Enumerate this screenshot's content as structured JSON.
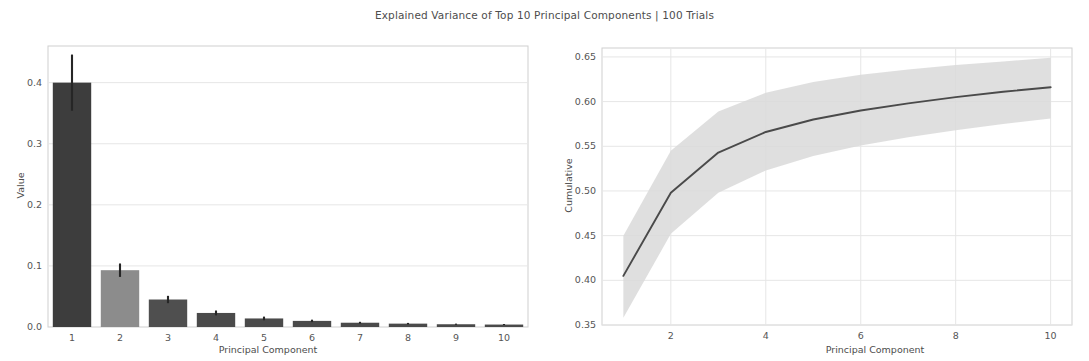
{
  "figure": {
    "title": "Explained Variance of Top 10 Principal Components | 100 Trials",
    "width": 1089,
    "height": 361,
    "background": "#ffffff",
    "text_color": "#4d4d4d"
  },
  "colors": {
    "bar_dark": "#3d3d3d",
    "bar_mid": "#8c8c8c",
    "bar_3": "#4f4f4f",
    "errorbar": "#262626",
    "line": "#4a4a4a",
    "band": "#d9d9d9",
    "grid": "#e6e6e6",
    "frame": "#cfcfcf"
  },
  "chart_data": [
    {
      "type": "bar",
      "panel": "left",
      "title": "",
      "xlabel": "Principal Component",
      "ylabel": "Value",
      "categories": [
        "1",
        "2",
        "3",
        "4",
        "5",
        "6",
        "7",
        "8",
        "9",
        "10"
      ],
      "values": [
        0.4,
        0.093,
        0.045,
        0.023,
        0.014,
        0.01,
        0.007,
        0.0055,
        0.0045,
        0.004
      ],
      "errors": [
        0.046,
        0.011,
        0.006,
        0.004,
        0.003,
        0.002,
        0.0015,
        0.0012,
        0.001,
        0.0009
      ],
      "bar_colors": [
        "#3d3d3d",
        "#8c8c8c",
        "#4f4f4f",
        "#4a4a4a",
        "#4a4a4a",
        "#4a4a4a",
        "#4a4a4a",
        "#4a4a4a",
        "#4a4a4a",
        "#4a4a4a"
      ],
      "ylim": [
        0.0,
        0.46
      ],
      "yticks": [
        0.0,
        0.1,
        0.2,
        0.3,
        0.4
      ],
      "ytick_labels": [
        "0.0",
        "0.1",
        "0.2",
        "0.3",
        "0.4"
      ],
      "xtick_labels": [
        "1",
        "2",
        "3",
        "4",
        "5",
        "6",
        "7",
        "8",
        "9",
        "10"
      ],
      "grid": true,
      "legend": "none"
    },
    {
      "type": "line",
      "panel": "right",
      "title": "",
      "xlabel": "Principal Component",
      "ylabel": "Cumulative",
      "x": [
        1,
        2,
        3,
        4,
        5,
        6,
        7,
        8,
        9,
        10
      ],
      "series": [
        {
          "name": "Cumulative explained variance",
          "values": [
            0.405,
            0.498,
            0.543,
            0.566,
            0.58,
            0.59,
            0.598,
            0.605,
            0.611,
            0.616
          ]
        }
      ],
      "band_upper": [
        0.45,
        0.545,
        0.589,
        0.61,
        0.622,
        0.63,
        0.636,
        0.641,
        0.645,
        0.649
      ],
      "band_lower": [
        0.358,
        0.452,
        0.498,
        0.523,
        0.539,
        0.551,
        0.56,
        0.568,
        0.575,
        0.581
      ],
      "ylim": [
        0.35,
        0.66
      ],
      "yticks": [
        0.35,
        0.4,
        0.45,
        0.5,
        0.55,
        0.6,
        0.65
      ],
      "ytick_labels": [
        "0.35",
        "0.40",
        "0.45",
        "0.50",
        "0.55",
        "0.60",
        "0.65"
      ],
      "xlim": [
        0.55,
        10.45
      ],
      "xticks": [
        2,
        4,
        6,
        8,
        10
      ],
      "xtick_labels": [
        "2",
        "4",
        "6",
        "8",
        "10"
      ],
      "grid": true,
      "legend": "none"
    }
  ]
}
